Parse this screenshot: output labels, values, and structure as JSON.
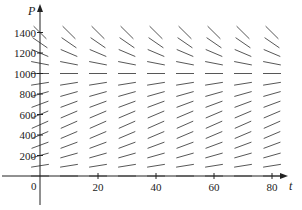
{
  "chart_data": {
    "type": "direction_field",
    "title": "",
    "xlabel": "t",
    "ylabel": "P",
    "xlim": [
      0,
      85
    ],
    "ylim": [
      -220,
      1500
    ],
    "x_ticks": [
      0,
      20,
      40,
      60,
      80
    ],
    "x_tick_labels": [
      "0",
      "20",
      "40",
      "60",
      "80"
    ],
    "y_ticks": [
      200,
      400,
      600,
      800,
      1000,
      1200,
      1400
    ],
    "y_tick_labels": [
      "200",
      "400",
      "600",
      "800",
      "1000",
      "1200",
      "1400"
    ],
    "origin_label": "0",
    "equation": "dP/dt = kP(1 - P/1000)",
    "equilibrium": 1000,
    "k": 0.05,
    "grid_t": [
      0,
      10,
      20,
      30,
      40,
      50,
      60,
      70,
      80
    ],
    "grid_P": [
      0,
      100,
      200,
      300,
      400,
      500,
      600,
      700,
      800,
      900,
      1000,
      1100,
      1200,
      1300,
      1400
    ],
    "grid": false,
    "legend": null,
    "colors": {
      "segment": "#444444",
      "axis": "#222222"
    }
  }
}
